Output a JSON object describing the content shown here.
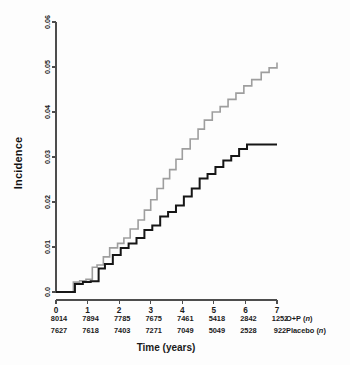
{
  "figure": {
    "background_color": "#fdfdfd",
    "axis_color": "#4d4d4d",
    "text_color": "#1a1a1a"
  },
  "axes": {
    "y_title": "Incidence",
    "x_title": "Time (years)",
    "y_ticks": [
      "0.0",
      "0.01",
      "0.02",
      "0.03",
      "0.04",
      "0.05",
      "0.06"
    ],
    "x_ticks": [
      "0",
      "1",
      "2",
      "3",
      "4",
      "5",
      "6",
      "7"
    ]
  },
  "risk_table": {
    "row1_label": "O+P (",
    "row1_label_n": "n",
    "row1_label_end": ")",
    "row2_label": "Placebo (",
    "row2_label_n": "n",
    "row2_label_end": ")",
    "row1_values": [
      "8014",
      "7894",
      "7785",
      "7675",
      "7461",
      "5418",
      "2842",
      "1252"
    ],
    "row2_values": [
      "7627",
      "7618",
      "7403",
      "7271",
      "7049",
      "5049",
      "2528",
      "922"
    ]
  },
  "chart_data": {
    "type": "line",
    "title": "",
    "xlabel": "Time (years)",
    "ylabel": "Incidence",
    "xlim": [
      0,
      7
    ],
    "ylim": [
      0.0,
      0.06
    ],
    "grid": false,
    "legend_position": "none",
    "step_style": "post",
    "series": [
      {
        "name": "O+P",
        "color": "#9e9e9e",
        "linewidth": 1.6,
        "n_at_risk": [
          8014,
          7894,
          7785,
          7675,
          7461,
          5418,
          2842,
          1252
        ],
        "x": [
          0.0,
          0.45,
          0.55,
          0.75,
          0.95,
          1.15,
          1.3,
          1.5,
          1.7,
          1.95,
          2.15,
          2.35,
          2.6,
          2.8,
          3.0,
          3.2,
          3.4,
          3.6,
          3.8,
          4.0,
          4.25,
          4.5,
          4.7,
          4.95,
          5.2,
          5.45,
          5.7,
          5.95,
          6.2,
          6.5,
          6.75,
          7.0
        ],
        "y": [
          0.0,
          0.0,
          0.0022,
          0.0025,
          0.0028,
          0.0055,
          0.006,
          0.0078,
          0.0098,
          0.0108,
          0.012,
          0.014,
          0.016,
          0.0182,
          0.0205,
          0.023,
          0.0252,
          0.0272,
          0.0295,
          0.0318,
          0.034,
          0.0362,
          0.0382,
          0.04,
          0.0412,
          0.0428,
          0.0442,
          0.0458,
          0.0472,
          0.0488,
          0.0498,
          0.051
        ]
      },
      {
        "name": "Placebo",
        "color": "#161616",
        "linewidth": 2.0,
        "n_at_risk": [
          7627,
          7618,
          7403,
          7271,
          7049,
          5049,
          2528,
          922
        ],
        "x": [
          0.0,
          0.45,
          0.6,
          0.85,
          1.1,
          1.35,
          1.55,
          1.8,
          2.05,
          2.3,
          2.55,
          2.8,
          3.05,
          3.3,
          3.55,
          3.8,
          4.05,
          4.3,
          4.55,
          4.8,
          5.05,
          5.3,
          5.55,
          5.8,
          6.05,
          7.0
        ],
        "y": [
          0.0,
          0.0,
          0.0018,
          0.0022,
          0.0024,
          0.0052,
          0.0062,
          0.0082,
          0.0098,
          0.0108,
          0.012,
          0.0138,
          0.0148,
          0.0168,
          0.0178,
          0.0192,
          0.0212,
          0.023,
          0.0252,
          0.0262,
          0.0278,
          0.0292,
          0.0302,
          0.0318,
          0.0328,
          0.0328
        ]
      }
    ]
  }
}
